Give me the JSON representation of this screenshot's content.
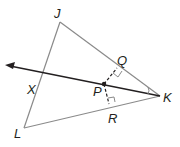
{
  "diagram": {
    "type": "geometry-triangle",
    "labels": {
      "J": "J",
      "K": "K",
      "L": "L",
      "X": "X",
      "P": "P",
      "Q": "Q",
      "R": "R"
    },
    "colors": {
      "triangle_stroke": "#8a8a8a",
      "ray_stroke": "#231f20",
      "label": "#231f20"
    }
  }
}
